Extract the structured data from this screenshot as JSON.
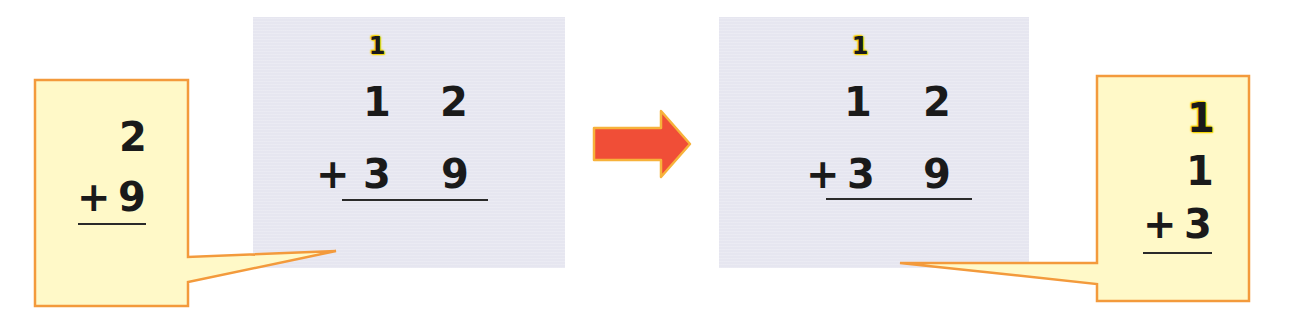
{
  "colors": {
    "panel_fill": "#e6e6f0",
    "callout_fill": "#fff9c8",
    "callout_border": "#f39a3c",
    "arrow_fill": "#f04e37",
    "arrow_edge": "#f7b23b",
    "carry_highlight": "#f5d400",
    "digit_color": "#1a1a1a"
  },
  "left_panel": {
    "carry": "1",
    "row1": {
      "tens": "1",
      "ones": "2"
    },
    "row2": {
      "operator": "+",
      "tens": "3",
      "ones": "9"
    }
  },
  "left_callout": {
    "row1": {
      "ones": "2"
    },
    "row2": {
      "operator": "+",
      "ones": "9"
    }
  },
  "arrow": {
    "icon": "right-arrow-icon",
    "direction": "right"
  },
  "right_panel": {
    "carry": "1",
    "row1": {
      "tens": "1",
      "ones": "2"
    },
    "row2": {
      "operator": "+",
      "tens": "3",
      "ones": "9"
    }
  },
  "right_callout": {
    "carry": "1",
    "row1": {
      "tens": "1"
    },
    "row2": {
      "operator": "+",
      "tens": "3"
    }
  }
}
